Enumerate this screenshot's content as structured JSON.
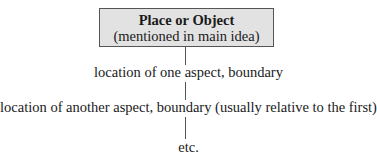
{
  "diagram": {
    "root": {
      "title": "Place or Object",
      "subtitle": "(mentioned in main idea)"
    },
    "steps": [
      {
        "label": "location of one aspect, boundary"
      },
      {
        "label": "location of another aspect, boundary (usually relative to the first)"
      },
      {
        "label": "etc."
      }
    ],
    "colors": {
      "box_fill": "#e2e2e2",
      "box_border": "#555555",
      "connector": "#555555",
      "text": "#1a1a1a"
    }
  }
}
